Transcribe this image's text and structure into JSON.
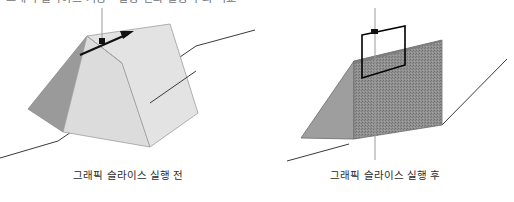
{
  "top_heading": {
    "text": "그래픽 슬라이스 기능 - 실행 전과 실행 후의 비교",
    "color": "#6f6f78",
    "clipped": true
  },
  "figures": [
    {
      "id": "before",
      "caption": "그래픽 슬라이스 실행 전",
      "shape": "triangular-prism",
      "description": "기울어진 삼각 프리즘(텐트 형태) 입체 도형",
      "faces": {
        "front_light": "#dcdcdc",
        "side_dark": "#9a9a9a",
        "top_ridge": "#e6e6e6"
      },
      "outline_color": "#8a8a8a",
      "annotation": {
        "vertical_guide_color": "#9a9a9a",
        "marker_color": "#111111",
        "arrow_color": "#111111",
        "arrow_direction": "up-right"
      },
      "cut_line_color": "#3a3a3a"
    },
    {
      "id": "after",
      "caption": "그래픽 슬라이스 실행 후",
      "shape": "sliced-wedge",
      "description": "슬라이스 실행 후 잘린 면이 드러난 쐐기 형태",
      "faces": {
        "slope_solid": "#9e9e9e",
        "cut_face_texture": "#8c8c8c",
        "texture_style": "halftone-dither"
      },
      "outline_color": "#6a6a6a",
      "annotation": {
        "vertical_guide_color": "#9a9a9a",
        "marker_color": "#111111",
        "slice_rect_color": "#000000",
        "slice_rect_label": "슬라이스 영역"
      },
      "cut_line_color": "#3a3a3a"
    }
  ],
  "canvas": {
    "width": 514,
    "height": 202,
    "background": "#ffffff"
  }
}
